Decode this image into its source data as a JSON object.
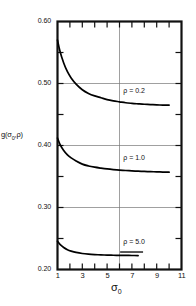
{
  "chart_data": {
    "type": "line",
    "title": "",
    "xlabel": "σ₀",
    "ylabel": "g(σ₀,ρ)",
    "xlim": [
      1,
      11
    ],
    "ylim": [
      0.2,
      0.6
    ],
    "grid": true,
    "grid_x": [
      6
    ],
    "grid_y": [
      0.3,
      0.4,
      0.5
    ],
    "xticks": [
      1,
      2,
      3,
      4,
      5,
      6,
      7,
      8,
      9,
      10,
      11
    ],
    "xtick_labels": [
      "1",
      "",
      "3",
      "",
      "5",
      "",
      "7",
      "",
      "9",
      "",
      "11"
    ],
    "yticks": [
      0.2,
      0.25,
      0.3,
      0.35,
      0.4,
      0.45,
      0.5,
      0.55,
      0.6
    ],
    "ytick_labels": [
      "0.20",
      "",
      "0.30",
      "",
      "0.40",
      "",
      "0.50",
      "",
      "0.60"
    ],
    "legend_position": "inline-annotations",
    "series": [
      {
        "name": "ρ = 0.2",
        "label": "ρ = 0.2",
        "x": [
          1.0,
          1.2,
          1.5,
          1.8,
          2.1,
          2.5,
          3.0,
          3.5,
          4.0,
          4.5,
          5.0,
          5.5,
          6.0,
          6.5,
          7.0,
          7.5,
          8.0,
          8.5,
          9.0,
          9.5,
          10.0
        ],
        "y": [
          0.57,
          0.552,
          0.533,
          0.519,
          0.509,
          0.499,
          0.49,
          0.484,
          0.48,
          0.477,
          0.474,
          0.472,
          0.4705,
          0.469,
          0.468,
          0.4672,
          0.4665,
          0.466,
          0.4655,
          0.4652,
          0.465
        ]
      },
      {
        "name": "ρ = 1.0",
        "label": "ρ = 1.0",
        "x": [
          1.0,
          1.2,
          1.5,
          1.8,
          2.1,
          2.5,
          3.0,
          3.5,
          4.0,
          4.5,
          5.0,
          5.5,
          6.0,
          6.5,
          7.0,
          7.5,
          8.0,
          8.5,
          9.0,
          9.5,
          10.0
        ],
        "y": [
          0.412,
          0.402,
          0.392,
          0.385,
          0.38,
          0.375,
          0.37,
          0.367,
          0.365,
          0.3635,
          0.3622,
          0.3612,
          0.3604,
          0.3597,
          0.3591,
          0.3586,
          0.3582,
          0.3578,
          0.3575,
          0.3572,
          0.357
        ]
      },
      {
        "name": "ρ = 5.0",
        "label": "ρ = 5.0",
        "x": [
          1.0,
          1.2,
          1.5,
          1.8,
          2.1,
          2.5,
          3.0,
          3.5,
          4.0,
          4.5,
          5.0,
          5.5,
          6.0,
          6.5,
          7.0,
          7.5
        ],
        "y": [
          0.2455,
          0.2405,
          0.2355,
          0.232,
          0.2297,
          0.2275,
          0.2258,
          0.2248,
          0.2241,
          0.2236,
          0.2232,
          0.223,
          0.2228,
          0.2227,
          0.2226,
          0.2225
        ]
      }
    ],
    "annotations": [
      {
        "text": "ρ = 0.2",
        "x": 6.3,
        "y": 0.487
      },
      {
        "text": "ρ = 1.0",
        "x": 6.3,
        "y": 0.378
      },
      {
        "text": "ρ = 5.0",
        "x": 6.3,
        "y": 0.243
      }
    ]
  },
  "axis": {
    "y_labels": [
      "0.60",
      "0.50",
      "0.40",
      "0.30",
      "0.20"
    ],
    "x_labels": [
      "1",
      "3",
      "5",
      "7",
      "9",
      "11"
    ],
    "y_title_main": "g(",
    "y_title_sigma": "σ",
    "y_title_sub": "0",
    "y_title_tail": ",ρ)",
    "x_title_sigma": "σ",
    "x_title_sub": "0"
  },
  "colors": {
    "frame": "#111111",
    "curve": "#000000",
    "grid": "#777777",
    "background": "#ffffff"
  }
}
